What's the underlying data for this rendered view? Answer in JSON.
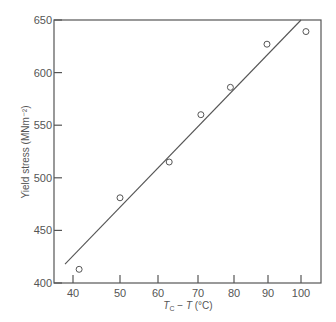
{
  "chart_data": {
    "type": "scatter",
    "title": "",
    "xlabel": "T_C - T (°C)",
    "xlabel_parts": {
      "t": "T",
      "sub": "C",
      "rest": " − ",
      "t2": "T",
      "unit": " (°C)"
    },
    "ylabel": "Yield stress (MNm⁻²)",
    "xlim": [
      35,
      105
    ],
    "ylim": [
      400,
      650
    ],
    "x_ticks": [
      40,
      50,
      60,
      70,
      80,
      90,
      100
    ],
    "y_ticks": [
      400,
      450,
      500,
      550,
      600,
      650
    ],
    "grid": false,
    "legend": null,
    "series": [
      {
        "name": "measured",
        "marker": "open-circle",
        "x": [
          41.3,
          50.0,
          62.8,
          70.8,
          79.0,
          89.7,
          101.5
        ],
        "y": [
          413,
          481,
          515,
          560,
          586,
          627,
          639
        ]
      },
      {
        "name": "fit",
        "style": "line",
        "x": [
          38.3,
          100.0
        ],
        "y": [
          418,
          650
        ]
      }
    ]
  },
  "colors": {
    "ink": "#555555",
    "background": "#ffffff"
  }
}
